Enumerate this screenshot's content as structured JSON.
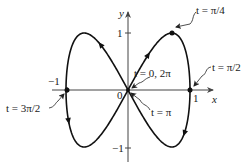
{
  "figure": {
    "type": "parametric-curve",
    "curve": {
      "x_of_t": "sin t",
      "y_of_t": "sin 2t",
      "t_range": [
        0,
        6.2832
      ]
    },
    "colors": {
      "curve": "#111111",
      "axes": "#444444",
      "text": "#1a1a1a",
      "background": "#ffffff"
    },
    "axes": {
      "x_label": "x",
      "y_label": "y",
      "x_ticks": [
        {
          "value": -1,
          "label": "−1"
        },
        {
          "value": 1,
          "label": "1"
        }
      ],
      "y_ticks": [
        {
          "value": 1,
          "label": "1"
        },
        {
          "value": -1,
          "label": "−1"
        }
      ],
      "origin_label": "0"
    },
    "annotations": [
      {
        "t_value": "t = π/4",
        "point": [
          0.707,
          1
        ]
      },
      {
        "t_value": "t = π/2",
        "point": [
          1,
          0
        ]
      },
      {
        "t_value": "t = 0, 2π",
        "point": [
          0,
          0
        ]
      },
      {
        "t_value": "t = π",
        "point": [
          0,
          0
        ]
      },
      {
        "t_value": "t = 3π/2",
        "point": [
          -1,
          0
        ]
      }
    ],
    "marked_points": [
      [
        0.707,
        1
      ],
      [
        1,
        0
      ],
      [
        -1,
        0
      ],
      [
        0,
        0
      ]
    ]
  }
}
